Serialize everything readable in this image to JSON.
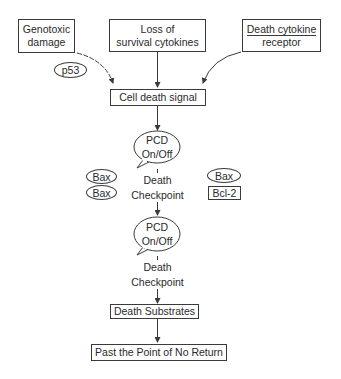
{
  "diagram": {
    "title": "",
    "inputs": {
      "genotoxic": {
        "line1": "Genotoxic",
        "line2": "damage"
      },
      "loss": {
        "line1": "Loss of",
        "line2": "survival cytokines"
      },
      "receptor": {
        "line1": "Death cytokine",
        "line2": "receptor"
      }
    },
    "p53": "p53",
    "cell_death_signal": "Cell death signal",
    "pcd1": {
      "line1": "PCD",
      "line2": "On/Off"
    },
    "checkpoint1": {
      "line1": "Death",
      "line2": "Checkpoint"
    },
    "left_factors": [
      "Bax",
      "Bax"
    ],
    "right_factors": {
      "bax": "Bax",
      "bcl2": "Bcl-2"
    },
    "pcd2": {
      "line1": "PCD",
      "line2": "On/Off"
    },
    "checkpoint2": {
      "line1": "Death",
      "line2": "Checkpoint"
    },
    "death_substrates": "Death Substrates",
    "point_of_no_return": "Past the Point of No Return"
  },
  "colors": {
    "line": "#3a3a3a",
    "text": "#2a2a2a",
    "background": "#ffffff"
  }
}
